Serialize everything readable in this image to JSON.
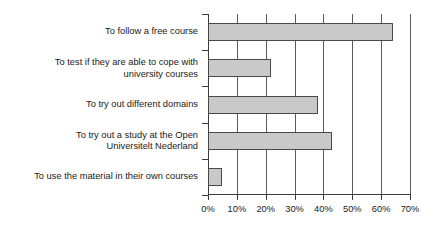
{
  "chart_data": {
    "type": "bar",
    "orientation": "horizontal",
    "title": "",
    "subtitle": "",
    "xlabel": "",
    "ylabel": "",
    "categories": [
      "To follow a free course",
      "To test if they are able to cope with\nuniversity courses",
      "To try out different domains",
      "To try out a study at the Open\nUniversitelt Nederland",
      "To use the material in their own courses"
    ],
    "values": [
      64,
      22,
      38,
      43,
      5
    ],
    "value_suffix": "%",
    "xlim": [
      0,
      70
    ],
    "xticks": [
      0,
      10,
      20,
      30,
      40,
      50,
      60,
      70
    ],
    "xtick_labels": [
      "0%",
      "10%",
      "20%",
      "30%",
      "40%",
      "50%",
      "60%",
      "70%"
    ],
    "grid": "vertical",
    "legend": "none",
    "bar_fill_color": "#c9c9c9",
    "bar_border_color": "#4a4a4a",
    "axis_color": "#3c3c3c",
    "gridline_color": "#5a5a5a",
    "background_color": "#ffffff",
    "text_color": "#1a1a1a"
  }
}
